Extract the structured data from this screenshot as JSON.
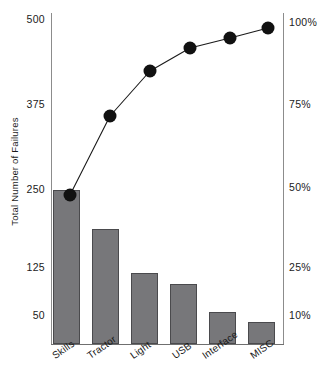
{
  "chart_data": {
    "type": "bar",
    "title": "",
    "subtitle": "",
    "xlabel": "",
    "ylabel": "Total Number of Failures",
    "y2label": "",
    "categories": [
      "Skills",
      "Tractor",
      "Light",
      "USB",
      "Interface",
      "MISC"
    ],
    "series": [
      {
        "name": "Total Number of Failures",
        "type": "bar",
        "axis": "left",
        "values": [
          248,
          185,
          105,
          88,
          56,
          42
        ]
      },
      {
        "name": "Cumulative Percentage",
        "type": "line",
        "axis": "right",
        "values": [
          47,
          72,
          85,
          91,
          96,
          100
        ]
      }
    ],
    "ylim": [
      0,
      500
    ],
    "y2lim": [
      0,
      100
    ],
    "yticks": [
      500,
      375,
      250,
      125,
      50
    ],
    "ytick_labels": [
      "500",
      "375",
      "250",
      "125",
      "50"
    ],
    "y2ticks": [
      100,
      75,
      50,
      25,
      10
    ],
    "y2tick_labels": [
      "100%",
      "75%",
      "50%",
      "25%",
      "10%"
    ],
    "grid": false,
    "legend": "none",
    "colors": {
      "bar_fill": "#77777a",
      "bar_edge": "#4a4a4d",
      "line": "#1a1a1a",
      "marker": "#111111",
      "axis": "#8c8c8c",
      "text": "#1b1b1b",
      "background": "#ffffff"
    }
  },
  "axis": {
    "left_title": "Total Number of Failures",
    "left_ticks": [
      {
        "label": "500",
        "y": 20
      },
      {
        "label": "375",
        "y": 105
      },
      {
        "label": "250",
        "y": 190
      },
      {
        "label": "125",
        "y": 268
      },
      {
        "label": "50",
        "y": 316
      }
    ],
    "right_ticks": [
      {
        "label": "100%",
        "y": 23
      },
      {
        "label": "75%",
        "y": 105
      },
      {
        "label": "50%",
        "y": 188
      },
      {
        "label": "25%",
        "y": 268
      },
      {
        "label": "10%",
        "y": 316
      }
    ]
  },
  "bars": [
    {
      "label": "Skills",
      "value": 248,
      "x": 53,
      "width": 27,
      "top": 190
    },
    {
      "label": "Tractor",
      "value": 185,
      "x": 92,
      "width": 27,
      "top": 229
    },
    {
      "label": "Light",
      "value": 105,
      "x": 131,
      "width": 27,
      "top": 273
    },
    {
      "label": "USB",
      "value": 88,
      "x": 170,
      "width": 27,
      "top": 284
    },
    {
      "label": "Interface",
      "value": 56,
      "x": 209,
      "width": 27,
      "top": 312
    },
    {
      "label": "MISC",
      "value": 42,
      "x": 248,
      "width": 27,
      "top": 322
    }
  ],
  "points": [
    {
      "label": "Skills",
      "percent": 47,
      "x": 70,
      "y": 195
    },
    {
      "label": "Tractor",
      "percent": 72,
      "x": 110,
      "y": 116
    },
    {
      "label": "Light",
      "percent": 85,
      "x": 150,
      "y": 71
    },
    {
      "label": "USB",
      "percent": 91,
      "x": 190,
      "y": 48
    },
    {
      "label": "Interface",
      "percent": 96,
      "x": 230,
      "y": 38
    },
    {
      "label": "MISC",
      "percent": 100,
      "x": 268,
      "y": 28
    }
  ],
  "category_labels": [
    {
      "text": "Skills",
      "x": 50,
      "y": 352
    },
    {
      "text": "Tractor",
      "x": 85,
      "y": 352
    },
    {
      "text": "Light",
      "x": 128,
      "y": 352
    },
    {
      "text": "USB",
      "x": 170,
      "y": 352
    },
    {
      "text": "Interface",
      "x": 200,
      "y": 352
    },
    {
      "text": "MISC",
      "x": 248,
      "y": 352
    }
  ]
}
